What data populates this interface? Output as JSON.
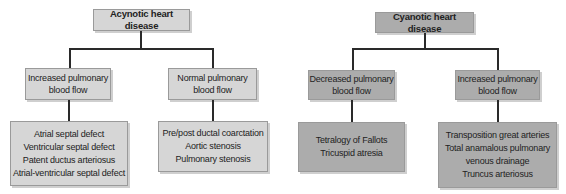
{
  "acyanotic": {
    "title": "Acynotic heart disease",
    "branches": [
      {
        "label_lines": [
          "Increased pulmonary",
          "blood flow"
        ],
        "conditions": [
          "Atrial septal defect",
          "Ventricular septal defect",
          "Patent ductus arteriosus",
          "Atrial-ventricular septal defect"
        ]
      },
      {
        "label_lines": [
          "Normal pulmonary",
          "blood flow"
        ],
        "conditions": [
          "Pre/post ductal coarctation",
          "Aortic stenosis",
          "Pulmonary stenosis"
        ]
      }
    ]
  },
  "cyanotic": {
    "title": "Cyanotic heart disease",
    "branches": [
      {
        "label_lines": [
          "Decreased pulmonary",
          "blood flow"
        ],
        "conditions": [
          "Tetralogy of Fallots",
          "Tricuspid atresia"
        ]
      },
      {
        "label_lines": [
          "Increased pulmonary",
          "blood flow"
        ],
        "conditions": [
          "Transposition great arteries",
          "Total anamalous pulmonary",
          "venous drainage",
          "Truncus arteriosus"
        ]
      }
    ]
  },
  "colors": {
    "acyanotic_fill": "#d6d6d6",
    "cyanotic_fill": "#acacac",
    "connector": "#2a2a2a"
  }
}
